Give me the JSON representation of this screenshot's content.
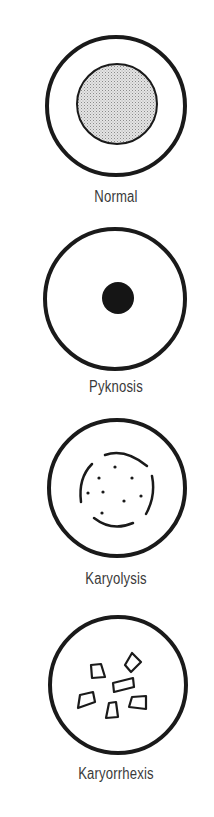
{
  "figure": {
    "type": "nuclear-changes-in-cell-death",
    "stroke_color": "#1a1a1a",
    "text_color": "#3a3a3a",
    "panels": [
      {
        "id": "normal",
        "label": "Normal",
        "nucleus": "stippled-round"
      },
      {
        "id": "pyknosis",
        "label": "Pyknosis",
        "nucleus": "small-dense-dot"
      },
      {
        "id": "karyolysis",
        "label": "Karyolysis",
        "nucleus": "fading-broken-membrane-with-dots"
      },
      {
        "id": "karyorrhexis",
        "label": "Karyorrhexis",
        "nucleus": "fragments"
      }
    ]
  }
}
